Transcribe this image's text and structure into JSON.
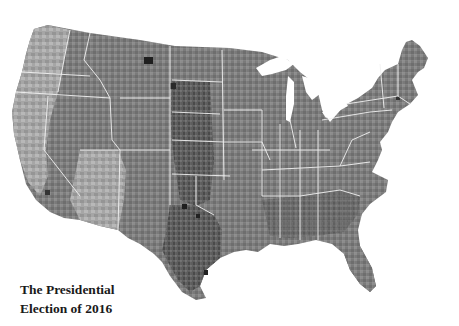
{
  "map": {
    "subject": "United States counties, 2016 presidential election",
    "style": "grayscale choropleth",
    "colors": {
      "background": "#ffffff",
      "state_border": "#f2f2f2",
      "shade_light": "#c8c8c8",
      "shade_mid": "#8a8a8a",
      "shade_dark": "#555555",
      "shade_darkest": "#222222"
    }
  },
  "title": {
    "line1": "The Presidential",
    "line2": "Election of 2016"
  }
}
